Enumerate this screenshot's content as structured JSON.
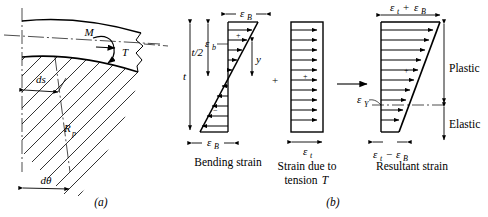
{
  "figure": {
    "panel_a": {
      "label": "(a)",
      "annotations": [
        {
          "name": "moment",
          "text": "M"
        },
        {
          "name": "tension",
          "text": "T"
        },
        {
          "name": "arc-length",
          "text": "ds"
        },
        {
          "name": "plastic-radius",
          "text": "R"
        },
        {
          "name": "plastic-radius-sub",
          "text": "p"
        },
        {
          "name": "angle-increment",
          "text": "dθ"
        }
      ]
    },
    "panel_b": {
      "label": "(b)",
      "diagrams": [
        {
          "name": "bending-strain",
          "caption": "Bending strain",
          "labels": {
            "top_strain": "ε",
            "top_strain_sub": "B",
            "bottom_strain": "ε",
            "bottom_strain_sub": "B",
            "local_strain": "ε",
            "local_strain_sub": "b",
            "half_thickness": "t/2",
            "thickness": "t",
            "distance": "y",
            "sign_positive": "+",
            "sign_negative": "−"
          }
        },
        {
          "name": "tension-strain",
          "caption_line1": "Strain due to",
          "caption_line2": "tension",
          "caption_symbol": "T",
          "labels": {
            "strain": "ε",
            "strain_sub": "t",
            "sign_positive": "+"
          }
        },
        {
          "name": "resultant-strain",
          "caption": "Resultant strain",
          "labels": {
            "top_strain": "ε",
            "top_strain_sub": "t",
            "top_plus": "+",
            "top_strain2": "ε",
            "top_strain2_sub": "B",
            "bottom_strain": "ε",
            "bottom_strain_sub": "t",
            "bottom_minus": "−",
            "bottom_strain2": "ε",
            "bottom_strain2_sub": "B",
            "yield_strain": "ε",
            "yield_strain_sub": "Y",
            "region_plastic": "Plastic",
            "region_elastic": "Elastic",
            "sign_positive": "+"
          }
        }
      ],
      "operators": {
        "plus": "+",
        "arrow": "→"
      }
    }
  },
  "colors": {
    "line": "#000000",
    "background": "#ffffff"
  }
}
